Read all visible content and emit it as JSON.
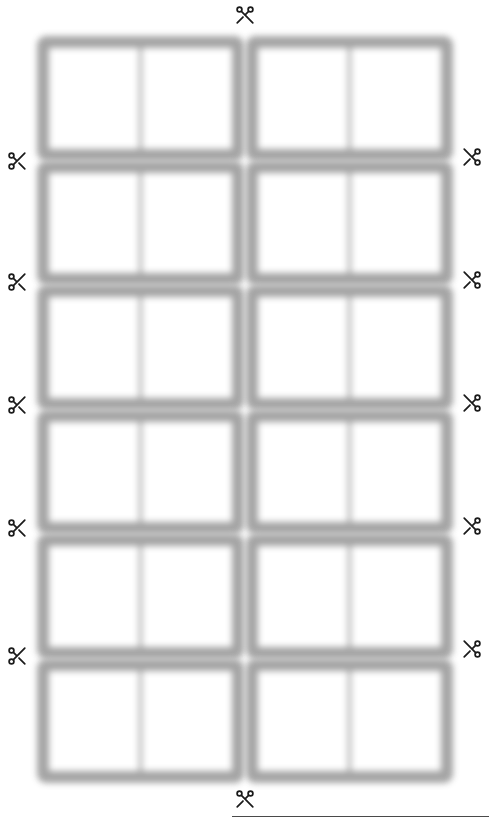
{
  "page": {
    "background_color": "#ffffff",
    "width": 489,
    "height": 825
  },
  "sheet": {
    "type": "cut-out-card-template",
    "rows": 6,
    "columns": 4,
    "column_groups": 2,
    "cells_per_group": 2,
    "total_cells": 24,
    "frame_color": "#9d9d9d",
    "cell_fill_color": "#ffffff",
    "cell_label": "blank-card",
    "cells": [
      {
        "row": 1,
        "col": 1,
        "text": ""
      },
      {
        "row": 1,
        "col": 2,
        "text": ""
      },
      {
        "row": 1,
        "col": 3,
        "text": ""
      },
      {
        "row": 1,
        "col": 4,
        "text": ""
      },
      {
        "row": 2,
        "col": 1,
        "text": ""
      },
      {
        "row": 2,
        "col": 2,
        "text": ""
      },
      {
        "row": 2,
        "col": 3,
        "text": ""
      },
      {
        "row": 2,
        "col": 4,
        "text": ""
      },
      {
        "row": 3,
        "col": 1,
        "text": ""
      },
      {
        "row": 3,
        "col": 2,
        "text": ""
      },
      {
        "row": 3,
        "col": 3,
        "text": ""
      },
      {
        "row": 3,
        "col": 4,
        "text": ""
      },
      {
        "row": 4,
        "col": 1,
        "text": ""
      },
      {
        "row": 4,
        "col": 2,
        "text": ""
      },
      {
        "row": 4,
        "col": 3,
        "text": ""
      },
      {
        "row": 4,
        "col": 4,
        "text": ""
      },
      {
        "row": 5,
        "col": 1,
        "text": ""
      },
      {
        "row": 5,
        "col": 2,
        "text": ""
      },
      {
        "row": 5,
        "col": 3,
        "text": ""
      },
      {
        "row": 5,
        "col": 4,
        "text": ""
      },
      {
        "row": 6,
        "col": 1,
        "text": ""
      },
      {
        "row": 6,
        "col": 2,
        "text": ""
      },
      {
        "row": 6,
        "col": 3,
        "text": ""
      },
      {
        "row": 6,
        "col": 4,
        "text": ""
      }
    ]
  },
  "cut_marks": {
    "icon": "scissors-icon",
    "color": "#1b1b1b",
    "top": [
      {
        "name": "cut-mark-top",
        "x": 245,
        "y": 3,
        "orientation": "down"
      }
    ],
    "bottom": [
      {
        "name": "cut-mark-bottom",
        "x": 245,
        "y": 786,
        "orientation": "down"
      }
    ],
    "left": [
      {
        "name": "cut-mark-left-1",
        "y": 150
      },
      {
        "name": "cut-mark-left-2",
        "y": 271
      },
      {
        "name": "cut-mark-left-3",
        "y": 394
      },
      {
        "name": "cut-mark-left-4",
        "y": 517
      },
      {
        "name": "cut-mark-left-5",
        "y": 645
      }
    ],
    "right": [
      {
        "name": "cut-mark-right-1",
        "y": 146
      },
      {
        "name": "cut-mark-right-2",
        "y": 269
      },
      {
        "name": "cut-mark-right-3",
        "y": 392
      },
      {
        "name": "cut-mark-right-4",
        "y": 515
      },
      {
        "name": "cut-mark-right-5",
        "y": 638
      }
    ]
  },
  "bottom_rule": {
    "name": "bottom-divider-line",
    "color": "#4a4a4a",
    "start_x": 232,
    "end_x": 489
  }
}
